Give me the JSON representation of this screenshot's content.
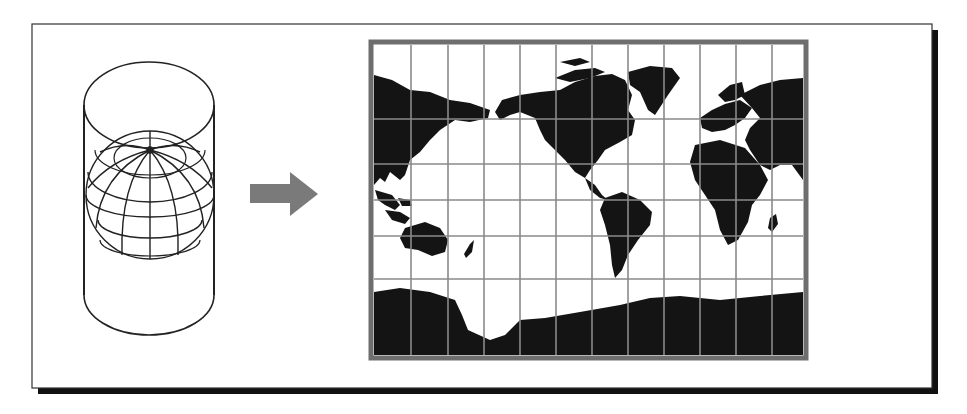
{
  "figure": {
    "colors": {
      "background": "#ffffff",
      "frame_border": "#333333",
      "frame_shadow": "#111111",
      "line_art": "#222222",
      "arrow": "#7a7a7a",
      "map_border": "#6e6e6e",
      "grid": "#8a8a8a",
      "land": "#141414",
      "ocean": "#ffffff"
    },
    "left_panel": {
      "label": "globe-in-cylinder",
      "cylinder": {
        "shape": "cylinder",
        "encloses": "globe"
      },
      "globe": {
        "graticule": "meridians and parallels",
        "pole_visible": "north"
      }
    },
    "arrow": {
      "direction": "right",
      "meaning": "projection"
    },
    "right_panel": {
      "label": "flat-world-map",
      "projection_type": "cylindrical (Mercator-style)",
      "grid": {
        "columns": 12,
        "rows": 7
      },
      "continents": [
        "North America",
        "South America",
        "Europe",
        "Africa",
        "Asia",
        "Australia",
        "Antarctica",
        "Greenland"
      ]
    }
  }
}
